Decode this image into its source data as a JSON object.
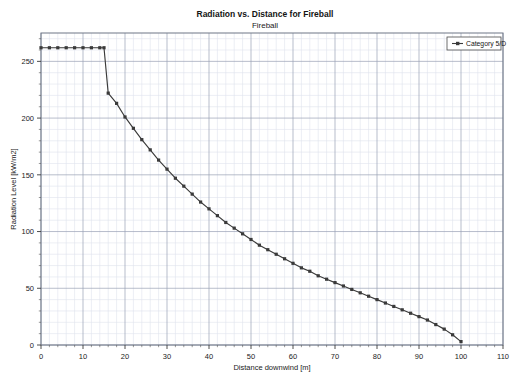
{
  "chart_data": {
    "type": "line",
    "title": "Radiation vs. Distance for Fireball",
    "subtitle": "Fireball",
    "xlabel": "Distance downwind [m]",
    "ylabel": "Radiation Level [kW/m2]",
    "xlim": [
      0,
      110
    ],
    "ylim": [
      0,
      275
    ],
    "xticks": [
      0,
      10,
      20,
      30,
      40,
      50,
      60,
      70,
      80,
      90,
      100,
      110
    ],
    "yticks": [
      0,
      50,
      100,
      150,
      200,
      250
    ],
    "xtick_labels": [
      "0",
      "10",
      "20",
      "30",
      "40",
      "50",
      "60",
      "70",
      "80",
      "90",
      "100",
      "110"
    ],
    "ytick_labels": [
      "0",
      "50",
      "100",
      "150",
      "200",
      "250"
    ],
    "x_minor_step": 2,
    "y_minor_step": 10,
    "grid": true,
    "grid_major_color": "#9aa0b4",
    "grid_minor_color": "#dfe2ec",
    "legend_position": "top-right",
    "series": [
      {
        "name": "Category 5/D",
        "color": "#3a3a3a",
        "marker": "square",
        "x": [
          0,
          2,
          4,
          6,
          8,
          10,
          12,
          14,
          15,
          16,
          18,
          20,
          22,
          24,
          26,
          28,
          30,
          32,
          34,
          36,
          38,
          40,
          42,
          44,
          46,
          48,
          50,
          52,
          54,
          56,
          58,
          60,
          62,
          64,
          66,
          68,
          70,
          72,
          74,
          76,
          78,
          80,
          82,
          84,
          86,
          88,
          90,
          92,
          94,
          96,
          98,
          100
        ],
        "values": [
          262,
          262,
          262,
          262,
          262,
          262,
          262,
          262,
          262,
          222,
          213,
          201,
          191,
          181,
          172,
          163,
          155,
          147,
          140,
          133,
          126,
          120,
          114,
          108,
          103,
          98,
          93,
          88,
          84,
          80,
          76,
          72,
          68,
          65,
          61,
          58,
          55,
          52,
          49,
          46,
          43,
          40,
          37,
          34,
          31,
          28,
          25,
          22,
          18,
          14,
          9,
          3
        ]
      }
    ]
  },
  "legend": {
    "entries": [
      {
        "label": "Category 5/D"
      }
    ]
  }
}
